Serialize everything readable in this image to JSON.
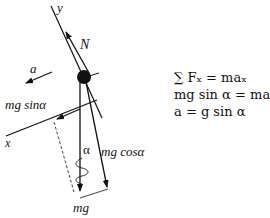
{
  "diagram": {
    "labels": {
      "y_axis": "y",
      "x_axis": "x",
      "normal_force": "N",
      "acceleration": "a",
      "mg_sin": "mg sinα",
      "mg_cos": "mg cosα",
      "weight": "mg",
      "angle": "α"
    },
    "equations": [
      "∑ Fₓ = maₓ",
      "mg sin α = ma",
      "a = g sin α"
    ],
    "colors": {
      "ink": "#111111",
      "background": "#ffffff"
    }
  }
}
